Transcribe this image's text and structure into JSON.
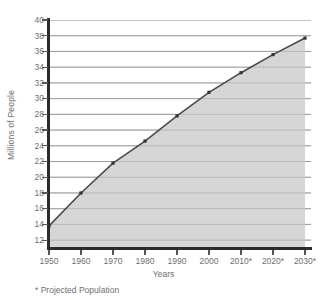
{
  "chart_data": {
    "type": "area",
    "title": "",
    "xlabel": "Years",
    "ylabel": "Millions of People",
    "categories": [
      "1950",
      "1960",
      "1970",
      "1980",
      "1990",
      "2000",
      "2010*",
      "2020*",
      "2030*"
    ],
    "values": [
      13.8,
      18.0,
      21.8,
      24.6,
      27.8,
      30.8,
      33.3,
      35.6,
      37.7
    ],
    "xlim": [
      1950,
      2030
    ],
    "ylim": [
      11,
      40
    ],
    "ytick_labels": [
      "40",
      "38",
      "36",
      "34",
      "32",
      "30",
      "28",
      "26",
      "24",
      "22",
      "20",
      "18",
      "16",
      "14",
      "12"
    ],
    "ytick_values": [
      40,
      38,
      36,
      34,
      32,
      30,
      28,
      26,
      24,
      22,
      20,
      18,
      16,
      14,
      12
    ],
    "grid": true,
    "legend": "none",
    "annotation": "* Projected Population",
    "series_name": "Population",
    "colors": {
      "line": "#4a4a4a",
      "fill": "#d6d6d6",
      "grid": "#9a9a9a",
      "axis": "#2b2b2b",
      "text": "#6f6f6f"
    }
  },
  "footnote": {
    "text": "* Projected Population"
  },
  "axes": {
    "x_title": "Years",
    "y_title": "Millions of People"
  }
}
